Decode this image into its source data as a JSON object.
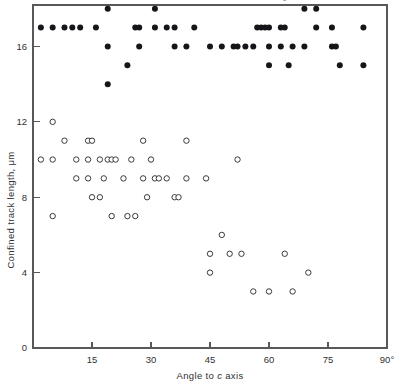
{
  "chart_data": {
    "type": "scatter",
    "title": "",
    "xlabel": "Angle to c axis",
    "ylabel": "Confined track length, μm",
    "xlim": [
      0,
      90
    ],
    "ylim": [
      0,
      18.2
    ],
    "grid": false,
    "legend": "none",
    "xticks": [
      15,
      30,
      45,
      60,
      75,
      90
    ],
    "xtick_labels": [
      "15",
      "30",
      "45",
      "60",
      "75",
      "90°"
    ],
    "yticks": [
      0,
      4,
      8,
      12,
      16
    ],
    "ytick_labels": [
      "0",
      "4",
      "8",
      "12",
      "16"
    ],
    "xunit": "degrees",
    "yunit": "μm",
    "series": [
      {
        "name": "long confined tracks",
        "marker": "filled-circle",
        "color": "#16161a",
        "points": [
          [
            2,
            17
          ],
          [
            5,
            17
          ],
          [
            8,
            17
          ],
          [
            10,
            17
          ],
          [
            12,
            17
          ],
          [
            16,
            17
          ],
          [
            19,
            18
          ],
          [
            19,
            16
          ],
          [
            19,
            14
          ],
          [
            24,
            15
          ],
          [
            26,
            17
          ],
          [
            27,
            17
          ],
          [
            27,
            16
          ],
          [
            31,
            17
          ],
          [
            31,
            18
          ],
          [
            34,
            17
          ],
          [
            36,
            17
          ],
          [
            36,
            16
          ],
          [
            39,
            16
          ],
          [
            41,
            17
          ],
          [
            45,
            16
          ],
          [
            48,
            16
          ],
          [
            51,
            16
          ],
          [
            52,
            16
          ],
          [
            54,
            16
          ],
          [
            56,
            16
          ],
          [
            57,
            17
          ],
          [
            58,
            17
          ],
          [
            59,
            17
          ],
          [
            60,
            17
          ],
          [
            60,
            16
          ],
          [
            60,
            15
          ],
          [
            63,
            17
          ],
          [
            64,
            17
          ],
          [
            64,
            18.6
          ],
          [
            63,
            16
          ],
          [
            65,
            15
          ],
          [
            66,
            16
          ],
          [
            69,
            18
          ],
          [
            69,
            16
          ],
          [
            72,
            17
          ],
          [
            72,
            18
          ],
          [
            76,
            17
          ],
          [
            76,
            16
          ],
          [
            77,
            16
          ],
          [
            78,
            15
          ],
          [
            84,
            17
          ],
          [
            84,
            15
          ]
        ]
      },
      {
        "name": "short confined tracks",
        "marker": "open-circle",
        "color": "#3a3a3e",
        "points": [
          [
            2,
            10
          ],
          [
            5,
            10
          ],
          [
            5,
            12
          ],
          [
            5,
            7
          ],
          [
            8,
            11
          ],
          [
            11,
            9
          ],
          [
            11,
            10
          ],
          [
            14,
            11
          ],
          [
            15,
            11
          ],
          [
            14,
            10
          ],
          [
            14,
            9
          ],
          [
            15,
            8
          ],
          [
            17,
            10
          ],
          [
            18,
            9
          ],
          [
            19,
            10
          ],
          [
            17,
            8
          ],
          [
            20,
            10
          ],
          [
            21,
            10
          ],
          [
            20,
            7
          ],
          [
            23,
            9
          ],
          [
            25,
            10
          ],
          [
            24,
            7
          ],
          [
            26,
            7
          ],
          [
            28,
            11
          ],
          [
            28,
            9
          ],
          [
            29,
            8
          ],
          [
            30,
            10
          ],
          [
            31,
            9
          ],
          [
            32,
            9
          ],
          [
            34,
            9
          ],
          [
            36,
            8
          ],
          [
            37,
            8
          ],
          [
            39,
            11
          ],
          [
            39,
            9
          ],
          [
            44,
            9
          ],
          [
            45,
            5
          ],
          [
            45,
            4
          ],
          [
            48,
            6
          ],
          [
            50,
            5
          ],
          [
            52,
            10
          ],
          [
            53,
            5
          ],
          [
            56,
            3
          ],
          [
            60,
            3
          ],
          [
            64,
            5
          ],
          [
            66,
            3
          ],
          [
            70,
            4
          ]
        ]
      }
    ]
  },
  "figure": {
    "name": "confined-track-length-vs-angle-scatter",
    "background": "#ffffff",
    "frame_color": "#58585a",
    "text_color": "#303033"
  }
}
